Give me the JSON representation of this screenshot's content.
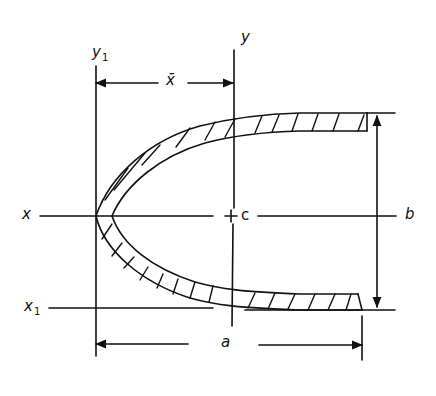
{
  "diagram": {
    "labels": {
      "y1": "y",
      "y1_sub": "1",
      "y": "y",
      "xbar": "x̄",
      "x": "x",
      "c": "c",
      "b": "b",
      "x1": "x",
      "x1_sub": "1",
      "a": "a"
    },
    "colors": {
      "stroke": "#111111",
      "background": "#ffffff"
    }
  }
}
